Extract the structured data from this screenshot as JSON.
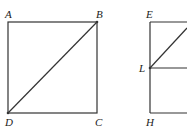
{
  "diagram": {
    "stroke_color": "#333333",
    "figures": [
      {
        "name": "square-abcd",
        "vertices": {
          "A": [
            8,
            22
          ],
          "B": [
            97,
            22
          ],
          "C": [
            97,
            113
          ],
          "D": [
            8,
            113
          ]
        },
        "diagonal": [
          "D",
          "B"
        ]
      },
      {
        "name": "figure-ehl",
        "vertices": {
          "E": [
            150,
            22
          ],
          "H": [
            150,
            113
          ],
          "L": [
            150,
            68
          ]
        },
        "segments": [
          "E-top-edge",
          "E-H-left-edge",
          "H-bottom-edge",
          "L-horizontal",
          "L-diagonal-up-right"
        ]
      }
    ],
    "labels": {
      "A": "A",
      "B": "B",
      "C": "C",
      "D": "D",
      "E": "E",
      "H": "H",
      "L": "L"
    }
  }
}
